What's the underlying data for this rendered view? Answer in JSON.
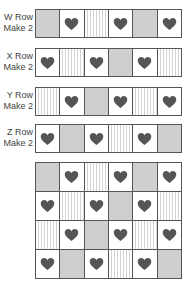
{
  "colors": {
    "heart": "#555555",
    "gray": "#cfcfcf",
    "stripe": "#d4d4d4",
    "border": "#555555"
  },
  "rows": [
    {
      "label1": "W Row",
      "label2": "Make 2",
      "cells": [
        "gray",
        "heart",
        "stripe",
        "heart",
        "gray",
        "heart"
      ]
    },
    {
      "label1": "X Row",
      "label2": "Make 2",
      "cells": [
        "heart",
        "stripe",
        "heart",
        "gray",
        "heart",
        "stripe"
      ]
    },
    {
      "label1": "Y Row",
      "label2": "Make 2",
      "cells": [
        "stripe",
        "heart",
        "gray",
        "heart",
        "stripe",
        "heart"
      ]
    },
    {
      "label1": "Z Row",
      "label2": "Make 2",
      "cells": [
        "heart",
        "gray",
        "heart",
        "stripe",
        "heart",
        "gray"
      ]
    }
  ],
  "assembled_grid": [
    [
      "gray",
      "heart",
      "stripe",
      "heart",
      "gray",
      "heart"
    ],
    [
      "heart",
      "stripe",
      "heart",
      "gray",
      "heart",
      "stripe"
    ],
    [
      "stripe",
      "heart",
      "gray",
      "heart",
      "stripe",
      "heart"
    ],
    [
      "heart",
      "gray",
      "heart",
      "stripe",
      "heart",
      "gray"
    ]
  ]
}
